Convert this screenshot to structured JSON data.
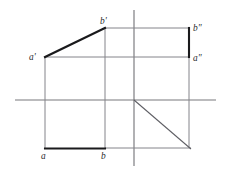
{
  "figure": {
    "canvas": {
      "width": 227,
      "height": 175
    },
    "background_color": "#ffffff",
    "colors": {
      "bold_stroke": "#1a1a1c",
      "thin_stroke": "#84848a",
      "axis_stroke": "#78787c",
      "mitre_stroke": "#5e5e64",
      "label_fill": "#2a2a2e"
    }
  },
  "labels": {
    "a_front": "a'",
    "b_front": "b'",
    "a_profile": "a\"",
    "b_profile": "a\"",
    "b_profile_top": "b\"",
    "a_top": "a",
    "b_top": "b"
  },
  "label_positions": {
    "a_front": {
      "x": 29,
      "y": 60
    },
    "b_front": {
      "x": 100,
      "y": 24
    },
    "b_profile": {
      "x": 193,
      "y": 31
    },
    "a_profile": {
      "x": 193,
      "y": 61
    },
    "a_top": {
      "x": 41,
      "y": 159
    },
    "b_top": {
      "x": 101,
      "y": 159
    }
  },
  "axes": {
    "horizontal": {
      "x1": 15,
      "y1": 100,
      "x2": 216,
      "y2": 100
    },
    "vertical": {
      "x1": 134,
      "y1": 10,
      "x2": 134,
      "y2": 166
    },
    "origin": {
      "x": 134,
      "y": 100
    }
  },
  "mitre": {
    "label": "45-degree mitre line",
    "x1": 134,
    "y1": 100,
    "x2": 191,
    "y2": 149
  },
  "points": {
    "a_front": {
      "x": 45,
      "y": 57
    },
    "b_front": {
      "x": 105,
      "y": 28
    },
    "a_profile": {
      "x": 189,
      "y": 57
    },
    "b_profile": {
      "x": 189,
      "y": 28
    },
    "a_top": {
      "x": 45,
      "y": 148
    },
    "b_top": {
      "x": 105,
      "y": 148
    }
  },
  "bold_segments": [
    {
      "name": "frontal-projection-ab",
      "x1": 45,
      "y1": 57,
      "x2": 105,
      "y2": 28
    },
    {
      "name": "profile-projection-ab",
      "x1": 189,
      "y1": 28,
      "x2": 189,
      "y2": 57
    },
    {
      "name": "horizontal-projection-ab",
      "x1": 45,
      "y1": 148,
      "x2": 105,
      "y2": 148
    }
  ],
  "thin_segments": [
    {
      "name": "projector-bprime-to-bsecond",
      "x1": 105,
      "y1": 28,
      "x2": 189,
      "y2": 28
    },
    {
      "name": "projector-aprime-to-asecond",
      "x1": 45,
      "y1": 57,
      "x2": 189,
      "y2": 57
    },
    {
      "name": "projector-aprime-to-a",
      "x1": 45,
      "y1": 57,
      "x2": 45,
      "y2": 148
    },
    {
      "name": "projector-bprime-to-b",
      "x1": 105,
      "y1": 28,
      "x2": 105,
      "y2": 148
    },
    {
      "name": "projector-b-to-mitre",
      "x1": 105,
      "y1": 148,
      "x2": 191,
      "y2": 148
    },
    {
      "name": "projector-mitre-to-asecond",
      "x1": 189,
      "y1": 57,
      "x2": 189,
      "y2": 148
    }
  ]
}
